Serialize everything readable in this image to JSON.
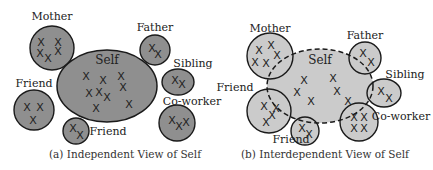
{
  "colors": {
    "independent_fill": "#8f8f8f",
    "interdependent_fill": "#cbcbcb",
    "stroke": "#1a1a1a"
  },
  "panels": [
    {
      "caption": "(a) Independent View of Self",
      "self": {
        "label": "Self",
        "cx": 107,
        "cy": 86,
        "rx": 50,
        "ry": 36,
        "dashed": false,
        "marks": [
          [
            86,
            76
          ],
          [
            103,
            80
          ],
          [
            121,
            76
          ],
          [
            89,
            93
          ],
          [
            99,
            92
          ],
          [
            107,
            97
          ],
          [
            123,
            87
          ],
          [
            96,
            108
          ],
          [
            129,
            104
          ]
        ]
      },
      "others": [
        {
          "label": "Mother",
          "cx": 52,
          "cy": 48,
          "rx": 22,
          "ry": 22,
          "lx": 52,
          "ly": 20,
          "marks": [
            [
              41,
              42
            ],
            [
              58,
              42
            ],
            [
              40,
              53
            ],
            [
              48,
              58
            ],
            [
              58,
              51
            ]
          ]
        },
        {
          "label": "Father",
          "cx": 155,
          "cy": 50,
          "rx": 15,
          "ry": 15,
          "lx": 155,
          "ly": 31,
          "marks": [
            [
              152,
              48
            ],
            [
              158,
              54
            ]
          ]
        },
        {
          "label": "Sibling",
          "cx": 178,
          "cy": 82,
          "rx": 16,
          "ry": 13,
          "lx": 193,
          "ly": 67,
          "marks": [
            [
              175,
              80
            ],
            [
              182,
              84
            ]
          ]
        },
        {
          "label": "Friend",
          "cx": 34,
          "cy": 110,
          "rx": 20,
          "ry": 20,
          "lx": 34,
          "ly": 87,
          "marks": [
            [
              27,
              107
            ],
            [
              40,
              107
            ],
            [
              33,
              120
            ]
          ]
        },
        {
          "label": "Friend",
          "cx": 76,
          "cy": 131,
          "rx": 13,
          "ry": 13,
          "lx": 108,
          "ly": 135,
          "marks": [
            [
              73,
              128
            ],
            [
              80,
              135
            ]
          ]
        },
        {
          "label": "Co-worker",
          "cx": 177,
          "cy": 123,
          "rx": 18,
          "ry": 18,
          "lx": 192,
          "ly": 105,
          "marks": [
            [
              172,
              120
            ],
            [
              179,
              126
            ],
            [
              186,
              122
            ]
          ]
        }
      ]
    },
    {
      "caption": "(b) Interdependent View of Self",
      "self": {
        "label": "Self",
        "cx": 320,
        "cy": 86,
        "rx": 53,
        "ry": 37,
        "dashed": true,
        "marks": [
          [
            304,
            80
          ],
          [
            297,
            92
          ],
          [
            311,
            101
          ],
          [
            333,
            78
          ],
          [
            337,
            91
          ],
          [
            348,
            101
          ]
        ]
      },
      "others": [
        {
          "label": "Mother",
          "cx": 270,
          "cy": 56,
          "rx": 23,
          "ry": 23,
          "lx": 270,
          "ly": 32,
          "marks": [
            [
              259,
              50
            ],
            [
              271,
              45
            ],
            [
              277,
              55
            ],
            [
              255,
              62
            ],
            [
              266,
              63
            ]
          ]
        },
        {
          "label": "Father",
          "cx": 365,
          "cy": 58,
          "rx": 16,
          "ry": 16,
          "lx": 365,
          "ly": 39,
          "marks": [
            [
              363,
              53
            ],
            [
              371,
              62
            ]
          ]
        },
        {
          "label": "Sibling",
          "cx": 384,
          "cy": 93,
          "rx": 17,
          "ry": 14,
          "lx": 405,
          "ly": 78,
          "marks": [
            [
              381,
              91
            ],
            [
              389,
              98
            ]
          ]
        },
        {
          "label": "Friend",
          "cx": 269,
          "cy": 111,
          "rx": 22,
          "ry": 22,
          "lx": 235,
          "ly": 91,
          "marks": [
            [
              264,
              106
            ],
            [
              276,
              108
            ],
            [
              272,
              115
            ],
            [
              266,
              122
            ]
          ]
        },
        {
          "label": "Friend",
          "cx": 305,
          "cy": 131,
          "rx": 14,
          "ry": 14,
          "lx": 291,
          "ly": 143,
          "marks": [
            [
              302,
              128
            ],
            [
              309,
              134
            ]
          ]
        },
        {
          "label": "Co-worker",
          "cx": 359,
          "cy": 122,
          "rx": 19,
          "ry": 19,
          "lx": 401,
          "ly": 120,
          "marks": [
            [
              354,
              117
            ],
            [
              364,
              117
            ],
            [
              354,
              128
            ],
            [
              364,
              128
            ]
          ]
        }
      ]
    }
  ]
}
